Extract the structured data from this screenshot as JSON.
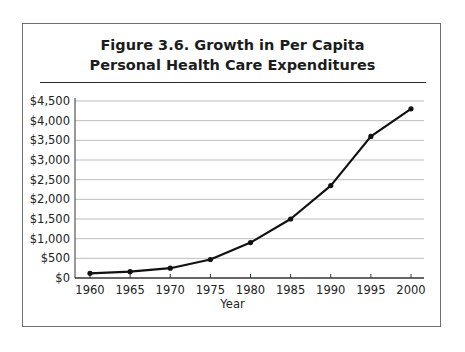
{
  "figure": {
    "title_line1": "Figure 3.6.  Growth in Per Capita",
    "title_line2": "Personal Health Care Expenditures"
  },
  "axes": {
    "xlabel": "Year",
    "yticks": [
      "$0",
      "$500",
      "$1,000",
      "$1,500",
      "$2,000",
      "$2,500",
      "$3,000",
      "$3,500",
      "$4,000",
      "$4,500"
    ],
    "xticks": [
      "1960",
      "1965",
      "1970",
      "1975",
      "1980",
      "1985",
      "1990",
      "1995",
      "2000"
    ]
  },
  "colors": {
    "line": "#111111",
    "grid": "#bdbdbd",
    "frame": "#6f6f6f"
  },
  "chart_data": {
    "type": "line",
    "title": "Figure 3.6. Growth in Per Capita Personal Health Care Expenditures",
    "xlabel": "Year",
    "ylabel": "",
    "x": [
      1960,
      1965,
      1970,
      1975,
      1980,
      1985,
      1990,
      1995,
      2000
    ],
    "series": [
      {
        "name": "Per capita personal health care expenditures",
        "values": [
          120,
          160,
          250,
          470,
          900,
          1500,
          2350,
          3600,
          4300
        ]
      }
    ],
    "ylim": [
      0,
      4500
    ],
    "ytick_step": 500,
    "grid": true,
    "legend": "none",
    "markers": true
  }
}
